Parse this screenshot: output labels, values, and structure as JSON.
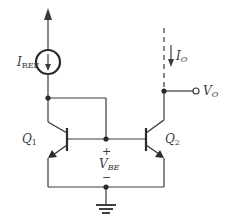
{
  "diagram": {
    "type": "BJT current mirror",
    "colors": {
      "wire": "#3a3a3a",
      "background": "#ffffff"
    },
    "labels": {
      "iref_main": "I",
      "iref_sub": "REF",
      "io_main": "I",
      "io_sub": "O",
      "vo_main": "V",
      "vo_sub": "O",
      "q1_main": "Q",
      "q1_sub": "1",
      "q2_main": "Q",
      "q2_sub": "2",
      "vbe_main": "V",
      "vbe_sub": "BE",
      "vbe_plus": "+",
      "vbe_minus": "−"
    },
    "components": [
      {
        "id": "supply-arrow",
        "kind": "supply"
      },
      {
        "id": "iref-source",
        "kind": "current-source",
        "label": "I_REF"
      },
      {
        "id": "q1",
        "kind": "npn-transistor",
        "label": "Q_1"
      },
      {
        "id": "q2",
        "kind": "npn-transistor",
        "label": "Q_2"
      },
      {
        "id": "output-terminal",
        "kind": "open-terminal",
        "label": "V_O"
      },
      {
        "id": "ground",
        "kind": "ground"
      }
    ]
  }
}
